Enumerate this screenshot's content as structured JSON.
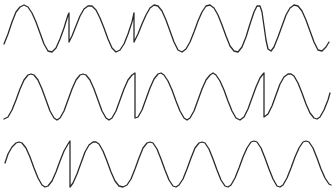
{
  "diagram": {
    "background": "#ffffff",
    "stroke_color": "#2a2a2a",
    "stroke_width": 1.3,
    "traces": [
      {
        "id": "trace-1",
        "points": [
          [
            4,
            44
          ],
          [
            8,
            34
          ],
          [
            12,
            22
          ],
          [
            16,
            12
          ],
          [
            20,
            7
          ],
          [
            24,
            5
          ],
          [
            28,
            7
          ],
          [
            32,
            13
          ],
          [
            36,
            22
          ],
          [
            40,
            33
          ],
          [
            44,
            44
          ],
          [
            48,
            51
          ],
          [
            52,
            52
          ],
          [
            56,
            48
          ],
          [
            60,
            39
          ],
          [
            64,
            28
          ],
          [
            68,
            15
          ],
          [
            69,
            13
          ],
          [
            69,
            42
          ],
          [
            72,
            36
          ],
          [
            76,
            26
          ],
          [
            80,
            16
          ],
          [
            84,
            9
          ],
          [
            88,
            6
          ],
          [
            92,
            6
          ],
          [
            96,
            10
          ],
          [
            100,
            18
          ],
          [
            104,
            28
          ],
          [
            108,
            39
          ],
          [
            112,
            48
          ],
          [
            116,
            52
          ],
          [
            120,
            50
          ],
          [
            124,
            44
          ],
          [
            128,
            34
          ],
          [
            132,
            22
          ],
          [
            134,
            13
          ],
          [
            134,
            42
          ],
          [
            138,
            34
          ],
          [
            142,
            24
          ],
          [
            146,
            15
          ],
          [
            150,
            8
          ],
          [
            154,
            5
          ],
          [
            158,
            6
          ],
          [
            162,
            11
          ],
          [
            166,
            20
          ],
          [
            170,
            31
          ],
          [
            174,
            42
          ],
          [
            178,
            50
          ],
          [
            182,
            52
          ],
          [
            186,
            49
          ],
          [
            190,
            42
          ],
          [
            194,
            32
          ],
          [
            198,
            21
          ],
          [
            202,
            12
          ],
          [
            206,
            6
          ],
          [
            210,
            5
          ],
          [
            214,
            8
          ],
          [
            218,
            15
          ],
          [
            222,
            25
          ],
          [
            226,
            36
          ],
          [
            230,
            46
          ],
          [
            234,
            51
          ],
          [
            238,
            52
          ],
          [
            242,
            47
          ],
          [
            246,
            37
          ],
          [
            250,
            24
          ],
          [
            254,
            12
          ],
          [
            257,
            6
          ],
          [
            260,
            6
          ],
          [
            262,
            12
          ],
          [
            264,
            26
          ],
          [
            266,
            40
          ],
          [
            268,
            49
          ],
          [
            271,
            51
          ],
          [
            274,
            47
          ],
          [
            278,
            37
          ],
          [
            282,
            26
          ],
          [
            286,
            15
          ],
          [
            290,
            8
          ],
          [
            294,
            5
          ],
          [
            298,
            6
          ],
          [
            302,
            11
          ],
          [
            306,
            20
          ],
          [
            310,
            31
          ],
          [
            314,
            42
          ],
          [
            318,
            50
          ],
          [
            322,
            51
          ],
          [
            326,
            47
          ],
          [
            329,
            42
          ]
        ]
      },
      {
        "id": "trace-2",
        "points": [
          [
            4,
            119
          ],
          [
            8,
            117
          ],
          [
            12,
            110
          ],
          [
            16,
            100
          ],
          [
            20,
            89
          ],
          [
            24,
            80
          ],
          [
            28,
            75
          ],
          [
            31,
            74
          ],
          [
            34,
            75
          ],
          [
            38,
            80
          ],
          [
            42,
            89
          ],
          [
            46,
            100
          ],
          [
            50,
            111
          ],
          [
            54,
            118
          ],
          [
            57,
            120
          ],
          [
            60,
            118
          ],
          [
            64,
            111
          ],
          [
            68,
            100
          ],
          [
            72,
            89
          ],
          [
            76,
            80
          ],
          [
            80,
            75
          ],
          [
            83,
            74
          ],
          [
            86,
            75
          ],
          [
            90,
            80
          ],
          [
            94,
            89
          ],
          [
            98,
            100
          ],
          [
            102,
            111
          ],
          [
            106,
            118
          ],
          [
            109,
            120
          ],
          [
            112,
            118
          ],
          [
            116,
            111
          ],
          [
            120,
            100
          ],
          [
            124,
            89
          ],
          [
            128,
            80
          ],
          [
            132,
            75
          ],
          [
            135,
            73
          ],
          [
            135,
            118
          ],
          [
            138,
            117
          ],
          [
            142,
            110
          ],
          [
            146,
            99
          ],
          [
            150,
            88
          ],
          [
            154,
            79
          ],
          [
            158,
            74
          ],
          [
            161,
            73
          ],
          [
            164,
            75
          ],
          [
            168,
            81
          ],
          [
            172,
            90
          ],
          [
            176,
            101
          ],
          [
            180,
            111
          ],
          [
            184,
            118
          ],
          [
            187,
            120
          ],
          [
            190,
            118
          ],
          [
            194,
            111
          ],
          [
            198,
            100
          ],
          [
            202,
            89
          ],
          [
            206,
            80
          ],
          [
            210,
            75
          ],
          [
            213,
            73
          ],
          [
            216,
            75
          ],
          [
            220,
            81
          ],
          [
            224,
            90
          ],
          [
            228,
            101
          ],
          [
            232,
            111
          ],
          [
            236,
            118
          ],
          [
            240,
            120
          ],
          [
            244,
            117
          ],
          [
            248,
            109
          ],
          [
            252,
            98
          ],
          [
            256,
            87
          ],
          [
            260,
            78
          ],
          [
            263,
            74
          ],
          [
            264,
            73
          ],
          [
            264,
            117
          ],
          [
            268,
            114
          ],
          [
            272,
            106
          ],
          [
            276,
            95
          ],
          [
            280,
            84
          ],
          [
            284,
            77
          ],
          [
            288,
            74
          ],
          [
            291,
            74
          ],
          [
            294,
            76
          ],
          [
            298,
            83
          ],
          [
            302,
            93
          ],
          [
            306,
            104
          ],
          [
            310,
            113
          ],
          [
            314,
            118
          ],
          [
            317,
            119
          ],
          [
            320,
            117
          ],
          [
            324,
            110
          ],
          [
            328,
            100
          ],
          [
            330,
            93
          ]
        ]
      },
      {
        "id": "trace-3",
        "points": [
          [
            5,
            163
          ],
          [
            8,
            154
          ],
          [
            12,
            147
          ],
          [
            16,
            143
          ],
          [
            19,
            142
          ],
          [
            22,
            143
          ],
          [
            26,
            148
          ],
          [
            30,
            157
          ],
          [
            34,
            168
          ],
          [
            38,
            178
          ],
          [
            42,
            185
          ],
          [
            45,
            187
          ],
          [
            48,
            186
          ],
          [
            52,
            181
          ],
          [
            56,
            172
          ],
          [
            60,
            161
          ],
          [
            64,
            151
          ],
          [
            68,
            144
          ],
          [
            70,
            141
          ],
          [
            70,
            187
          ],
          [
            73,
            183
          ],
          [
            77,
            174
          ],
          [
            81,
            163
          ],
          [
            85,
            152
          ],
          [
            89,
            145
          ],
          [
            93,
            142
          ],
          [
            96,
            142
          ],
          [
            99,
            144
          ],
          [
            103,
            151
          ],
          [
            107,
            161
          ],
          [
            111,
            172
          ],
          [
            115,
            181
          ],
          [
            119,
            186
          ],
          [
            123,
            187
          ],
          [
            127,
            185
          ],
          [
            131,
            179
          ],
          [
            135,
            169
          ],
          [
            139,
            158
          ],
          [
            143,
            148
          ],
          [
            147,
            143
          ],
          [
            150,
            142
          ],
          [
            153,
            143
          ],
          [
            157,
            149
          ],
          [
            161,
            159
          ],
          [
            165,
            170
          ],
          [
            169,
            180
          ],
          [
            173,
            186
          ],
          [
            176,
            187
          ],
          [
            179,
            185
          ],
          [
            183,
            179
          ],
          [
            187,
            169
          ],
          [
            191,
            158
          ],
          [
            195,
            148
          ],
          [
            199,
            143
          ],
          [
            202,
            142
          ],
          [
            205,
            143
          ],
          [
            209,
            149
          ],
          [
            213,
            159
          ],
          [
            217,
            170
          ],
          [
            221,
            180
          ],
          [
            225,
            186
          ],
          [
            228,
            187
          ],
          [
            231,
            185
          ],
          [
            235,
            178
          ],
          [
            239,
            168
          ],
          [
            243,
            157
          ],
          [
            247,
            148
          ],
          [
            251,
            142
          ],
          [
            254,
            141
          ],
          [
            257,
            142
          ],
          [
            261,
            148
          ],
          [
            265,
            158
          ],
          [
            269,
            169
          ],
          [
            273,
            179
          ],
          [
            277,
            186
          ],
          [
            280,
            187
          ],
          [
            283,
            185
          ],
          [
            287,
            178
          ],
          [
            291,
            168
          ],
          [
            295,
            157
          ],
          [
            299,
            148
          ],
          [
            303,
            142
          ],
          [
            306,
            141
          ],
          [
            309,
            142
          ],
          [
            313,
            148
          ],
          [
            317,
            158
          ],
          [
            321,
            169
          ],
          [
            325,
            178
          ],
          [
            329,
            184
          ],
          [
            331,
            185
          ]
        ]
      }
    ]
  }
}
